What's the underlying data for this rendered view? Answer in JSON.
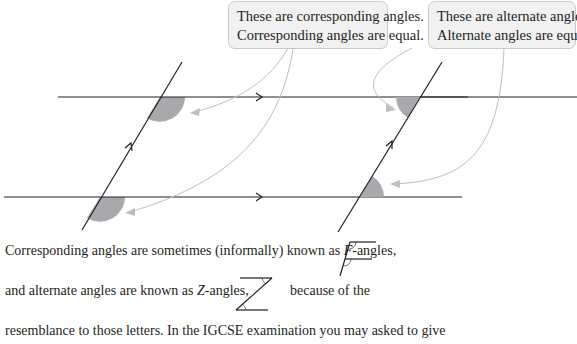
{
  "callouts": {
    "corresponding": {
      "line1": "These are corresponding angles.",
      "line2": "Corresponding angles are equal."
    },
    "alternate": {
      "line1": "These are alternate angles.",
      "line2": "Alternate angles are equal."
    }
  },
  "diagram": {
    "angle_fill": "#a7a9ac",
    "line_color": "#231f20",
    "arrow_color": "#bcbec0",
    "left_figure": "corresponding-angles",
    "right_figure": "alternate-angles"
  },
  "text": {
    "line1_pre": "Corresponding angles are sometimes (informally) known as ",
    "line1_letter": "F",
    "line1_post": "-angles,",
    "line2_pre": "and alternate angles are known as ",
    "line2_letter": "Z",
    "line2_mid": "-angles,",
    "line2_post": "because of the",
    "line3": "resemblance to those letters. In the IGCSE examination you may asked to give"
  },
  "icons": {
    "f_angle": "f-shape-icon",
    "z_angle": "z-shape-icon"
  }
}
